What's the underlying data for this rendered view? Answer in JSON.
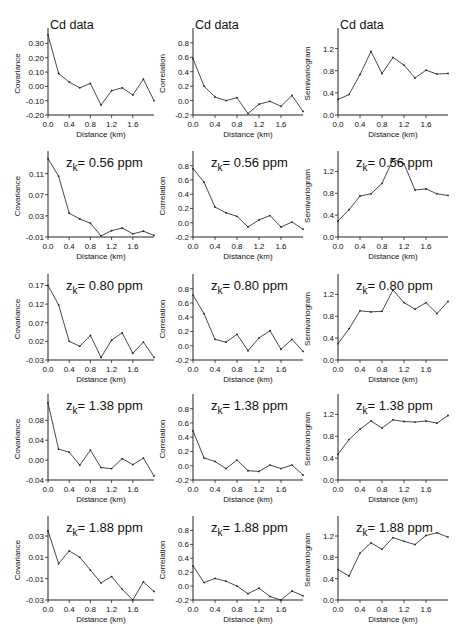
{
  "figure": {
    "columns": [
      "Covariance",
      "Correlation",
      "Semivariogram"
    ],
    "xlabel": "Distance (km)",
    "x_ticks": [
      "0.0",
      "0.4",
      "0.8",
      "1.2",
      "1.6"
    ]
  },
  "chart_data": [
    {
      "type": "line",
      "row": 0,
      "col": 0,
      "title": "Cd data",
      "xlabel": "Distance (km)",
      "ylabel": "Covariance",
      "x": [
        0.0,
        0.2,
        0.4,
        0.6,
        0.8,
        1.0,
        1.2,
        1.4,
        1.6,
        1.8,
        2.0
      ],
      "values": [
        0.36,
        0.09,
        0.03,
        -0.01,
        0.02,
        -0.13,
        -0.03,
        -0.01,
        -0.06,
        0.05,
        -0.1
      ],
      "ylim": [
        -0.2,
        0.38
      ],
      "y_ticks": [
        -0.2,
        -0.1,
        0.0,
        0.1,
        0.2,
        0.3
      ],
      "y_tick_labels": [
        "-0.20",
        "-0.10",
        "0.00",
        "0.10",
        "0.20",
        "0.30"
      ]
    },
    {
      "type": "line",
      "row": 0,
      "col": 1,
      "title": "Cd data",
      "xlabel": "Distance (km)",
      "ylabel": "Correlation",
      "x": [
        0.0,
        0.2,
        0.4,
        0.6,
        0.8,
        1.0,
        1.2,
        1.4,
        1.6,
        1.8,
        2.0
      ],
      "values": [
        0.58,
        0.2,
        0.05,
        0.0,
        0.04,
        -0.18,
        -0.05,
        -0.01,
        -0.08,
        0.07,
        -0.15
      ],
      "ylim": [
        -0.2,
        0.95
      ],
      "y_ticks": [
        -0.2,
        0.0,
        0.2,
        0.4,
        0.6,
        0.8
      ],
      "y_tick_labels": [
        "-0.2",
        "0.0",
        "0.2",
        "0.4",
        "0.6",
        "0.8"
      ]
    },
    {
      "type": "line",
      "row": 0,
      "col": 2,
      "title": "Cd data",
      "xlabel": "Distance (km)",
      "ylabel": "Semivariogram",
      "x": [
        0.0,
        0.2,
        0.4,
        0.6,
        0.8,
        1.0,
        1.2,
        1.4,
        1.6,
        1.8,
        2.0
      ],
      "values": [
        0.28,
        0.37,
        0.73,
        1.15,
        0.75,
        1.04,
        0.9,
        0.67,
        0.81,
        0.74,
        0.75
      ],
      "ylim": [
        0.0,
        1.5
      ],
      "y_ticks": [
        0.0,
        0.4,
        0.8,
        1.2
      ],
      "y_tick_labels": [
        "0.0",
        "0.4",
        "0.8",
        "1.2"
      ]
    },
    {
      "type": "line",
      "row": 1,
      "col": 0,
      "title": "z_k = 0.56 ppm",
      "xlabel": "Distance (km)",
      "ylabel": "Covariance",
      "x": [
        0.0,
        0.2,
        0.4,
        0.6,
        0.8,
        1.0,
        1.2,
        1.4,
        1.6,
        1.8,
        2.0
      ],
      "values": [
        0.138,
        0.105,
        0.035,
        0.024,
        0.016,
        -0.008,
        0.002,
        0.007,
        -0.004,
        0.001,
        -0.007
      ],
      "ylim": [
        -0.01,
        0.145
      ],
      "y_ticks": [
        -0.01,
        0.03,
        0.07,
        0.11
      ],
      "y_tick_labels": [
        "-0.01",
        "0.03",
        "0.07",
        "0.11"
      ]
    },
    {
      "type": "line",
      "row": 1,
      "col": 1,
      "title": "z_k = 0.56 ppm",
      "xlabel": "Distance (km)",
      "ylabel": "Correlation",
      "x": [
        0.0,
        0.2,
        0.4,
        0.6,
        0.8,
        1.0,
        1.2,
        1.4,
        1.6,
        1.8,
        2.0
      ],
      "values": [
        0.76,
        0.57,
        0.22,
        0.14,
        0.09,
        -0.06,
        0.04,
        0.1,
        -0.06,
        0.01,
        -0.09
      ],
      "ylim": [
        -0.2,
        0.95
      ],
      "y_ticks": [
        -0.2,
        0.0,
        0.2,
        0.4,
        0.6,
        0.8
      ],
      "y_tick_labels": [
        "-0.2",
        "0.0",
        "0.2",
        "0.4",
        "0.6",
        "0.8"
      ]
    },
    {
      "type": "line",
      "row": 1,
      "col": 2,
      "title": "z_k = 0.56 ppm",
      "xlabel": "Distance (km)",
      "ylabel": "Semivariogram",
      "x": [
        0.0,
        0.2,
        0.4,
        0.6,
        0.8,
        1.0,
        1.2,
        1.4,
        1.6,
        1.8,
        2.0
      ],
      "values": [
        0.29,
        0.5,
        0.75,
        0.79,
        0.98,
        1.42,
        1.34,
        0.86,
        0.88,
        0.79,
        0.76
      ],
      "ylim": [
        0.0,
        1.5
      ],
      "y_ticks": [
        0.0,
        0.4,
        0.8,
        1.2
      ],
      "y_tick_labels": [
        "0.0",
        "0.4",
        "0.8",
        "1.2"
      ]
    },
    {
      "type": "line",
      "row": 2,
      "col": 0,
      "title": "z_k = 0.80 ppm",
      "xlabel": "Distance (km)",
      "ylabel": "Covariance",
      "x": [
        0.0,
        0.2,
        0.4,
        0.6,
        0.8,
        1.0,
        1.2,
        1.4,
        1.6,
        1.8,
        2.0
      ],
      "values": [
        0.17,
        0.118,
        0.02,
        0.007,
        0.036,
        -0.023,
        0.023,
        0.043,
        -0.012,
        0.018,
        -0.023
      ],
      "ylim": [
        -0.03,
        0.19
      ],
      "y_ticks": [
        -0.03,
        0.02,
        0.07,
        0.12,
        0.17
      ],
      "y_tick_labels": [
        "-0.03",
        "0.02",
        "0.07",
        "0.12",
        "0.17"
      ]
    },
    {
      "type": "line",
      "row": 2,
      "col": 1,
      "title": "z_k = 0.80 ppm",
      "xlabel": "Distance (km)",
      "ylabel": "Correlation",
      "x": [
        0.0,
        0.2,
        0.4,
        0.6,
        0.8,
        1.0,
        1.2,
        1.4,
        1.6,
        1.8,
        2.0
      ],
      "values": [
        0.71,
        0.45,
        0.09,
        0.05,
        0.16,
        -0.07,
        0.11,
        0.21,
        -0.05,
        0.09,
        -0.08
      ],
      "ylim": [
        -0.2,
        0.95
      ],
      "y_ticks": [
        -0.2,
        0.0,
        0.2,
        0.4,
        0.6,
        0.8
      ],
      "y_tick_labels": [
        "-0.2",
        "0.0",
        "0.2",
        "0.4",
        "0.6",
        "0.8"
      ]
    },
    {
      "type": "line",
      "row": 2,
      "col": 2,
      "title": "z_k = 0.80 ppm",
      "xlabel": "Distance (km)",
      "ylabel": "Semivariogram",
      "x": [
        0.0,
        0.2,
        0.4,
        0.6,
        0.8,
        1.0,
        1.2,
        1.4,
        1.6,
        1.8,
        2.0
      ],
      "values": [
        0.3,
        0.57,
        0.9,
        0.88,
        0.89,
        1.28,
        1.05,
        0.93,
        1.05,
        0.85,
        1.07
      ],
      "ylim": [
        0.0,
        1.5
      ],
      "y_ticks": [
        0.0,
        0.4,
        0.8,
        1.2
      ],
      "y_tick_labels": [
        "0.0",
        "0.4",
        "0.8",
        "1.2"
      ]
    },
    {
      "type": "line",
      "row": 3,
      "col": 0,
      "title": "z_k = 1.38 ppm",
      "xlabel": "Distance (km)",
      "ylabel": "Covariance",
      "x": [
        0.0,
        0.2,
        0.4,
        0.6,
        0.8,
        1.0,
        1.2,
        1.4,
        1.6,
        1.8,
        2.0
      ],
      "values": [
        0.115,
        0.022,
        0.016,
        -0.01,
        0.02,
        -0.015,
        -0.017,
        0.003,
        -0.009,
        0.004,
        -0.032
      ],
      "ylim": [
        -0.04,
        0.125
      ],
      "y_ticks": [
        -0.04,
        0.0,
        0.04,
        0.08
      ],
      "y_tick_labels": [
        "-0.04",
        "0.00",
        "0.04",
        "0.08"
      ]
    },
    {
      "type": "line",
      "row": 3,
      "col": 1,
      "title": "z_k = 1.38 ppm",
      "xlabel": "Distance (km)",
      "ylabel": "Correlation",
      "x": [
        0.0,
        0.2,
        0.4,
        0.6,
        0.8,
        1.0,
        1.2,
        1.4,
        1.6,
        1.8,
        2.0
      ],
      "values": [
        0.49,
        0.11,
        0.06,
        -0.04,
        0.08,
        -0.07,
        -0.08,
        0.01,
        -0.04,
        0.01,
        -0.13
      ],
      "ylim": [
        -0.2,
        0.95
      ],
      "y_ticks": [
        -0.2,
        0.0,
        0.2,
        0.4,
        0.6,
        0.8
      ],
      "y_tick_labels": [
        "-0.2",
        "0.0",
        "0.2",
        "0.4",
        "0.6",
        "0.8"
      ]
    },
    {
      "type": "line",
      "row": 3,
      "col": 2,
      "title": "z_k = 1.38 ppm",
      "xlabel": "Distance (km)",
      "ylabel": "Semivariogram",
      "x": [
        0.0,
        0.2,
        0.4,
        0.6,
        0.8,
        1.0,
        1.2,
        1.4,
        1.6,
        1.8,
        2.0
      ],
      "values": [
        0.47,
        0.74,
        0.93,
        1.08,
        0.95,
        1.1,
        1.07,
        1.06,
        1.08,
        1.04,
        1.18
      ],
      "ylim": [
        0.0,
        1.5
      ],
      "y_ticks": [
        0.0,
        0.4,
        0.8,
        1.2
      ],
      "y_tick_labels": [
        "0.0",
        "0.4",
        "0.8",
        "1.2"
      ]
    },
    {
      "type": "line",
      "row": 4,
      "col": 0,
      "title": "z_k = 1.88 ppm",
      "xlabel": "Distance (km)",
      "ylabel": "Covariance",
      "x": [
        0.0,
        0.2,
        0.4,
        0.6,
        0.8,
        1.0,
        1.2,
        1.4,
        1.6,
        1.8,
        2.0
      ],
      "values": [
        0.035,
        0.004,
        0.016,
        0.01,
        -0.002,
        -0.014,
        -0.008,
        -0.02,
        -0.03,
        -0.013,
        -0.022
      ],
      "ylim": [
        -0.03,
        0.045
      ],
      "y_ticks": [
        -0.03,
        -0.01,
        0.01,
        0.03
      ],
      "y_tick_labels": [
        "-0.03",
        "-0.01",
        "0.01",
        "0.03"
      ]
    },
    {
      "type": "line",
      "row": 4,
      "col": 1,
      "title": "z_k = 1.88 ppm",
      "xlabel": "Distance (km)",
      "ylabel": "Correlation",
      "x": [
        0.0,
        0.2,
        0.4,
        0.6,
        0.8,
        1.0,
        1.2,
        1.4,
        1.6,
        1.8,
        2.0
      ],
      "values": [
        0.29,
        0.05,
        0.11,
        0.07,
        0.0,
        -0.11,
        -0.03,
        -0.15,
        -0.2,
        -0.07,
        -0.14
      ],
      "ylim": [
        -0.2,
        0.95
      ],
      "y_ticks": [
        -0.2,
        0.0,
        0.2,
        0.4,
        0.6,
        0.8
      ],
      "y_tick_labels": [
        "-0.2",
        "0.0",
        "0.2",
        "0.4",
        "0.6",
        "0.8"
      ]
    },
    {
      "type": "line",
      "row": 4,
      "col": 2,
      "title": "z_k = 1.88 ppm",
      "xlabel": "Distance (km)",
      "ylabel": "Semivariogram",
      "x": [
        0.0,
        0.2,
        0.4,
        0.6,
        0.8,
        1.0,
        1.2,
        1.4,
        1.6,
        1.8,
        2.0
      ],
      "values": [
        0.57,
        0.45,
        0.88,
        1.07,
        0.95,
        1.17,
        1.1,
        1.04,
        1.21,
        1.26,
        1.18
      ],
      "ylim": [
        0.0,
        1.5
      ],
      "y_ticks": [
        0.0,
        0.4,
        0.8,
        1.2
      ],
      "y_tick_labels": [
        "0.0",
        "0.4",
        "0.8",
        "1.2"
      ]
    }
  ]
}
